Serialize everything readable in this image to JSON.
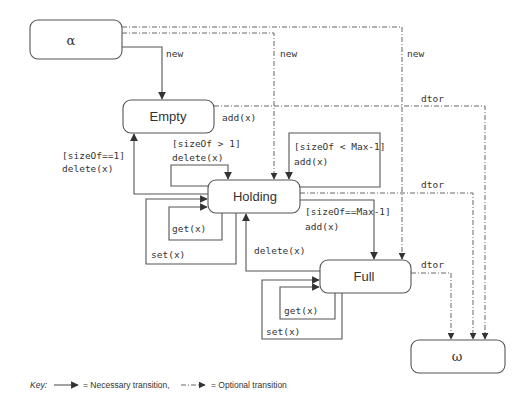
{
  "states": {
    "alpha": "α",
    "empty": "Empty",
    "holding": "Holding",
    "full": "Full",
    "omega": "ω"
  },
  "transitions": {
    "alpha_to_empty": "new",
    "alpha_to_holding": "new",
    "alpha_to_full": "new",
    "empty_add": "add(x)",
    "empty_dtor": "dtor",
    "holding_dtor": "dtor",
    "full_dtor": "dtor",
    "holding_delete_guard": "[sizeOf > 1]",
    "holding_delete_action": "delete(x)",
    "holding_add_guard": "[sizeOf < Max-1]",
    "holding_add_action": "add(x)",
    "holding_to_empty_guard": "[sizeOf==1]",
    "holding_to_empty_action": "delete(x)",
    "holding_to_full_guard": "[sizeOf==Max-1]",
    "holding_to_full_action": "add(x)",
    "full_to_holding": "delete(x)",
    "holding_get": "get(x)",
    "holding_set": "set(x)",
    "full_get": "get(x)",
    "full_set": "set(x)"
  },
  "key": {
    "label": "Key:",
    "necessary": "= Necessary transition,",
    "optional": "= Optional transition"
  }
}
